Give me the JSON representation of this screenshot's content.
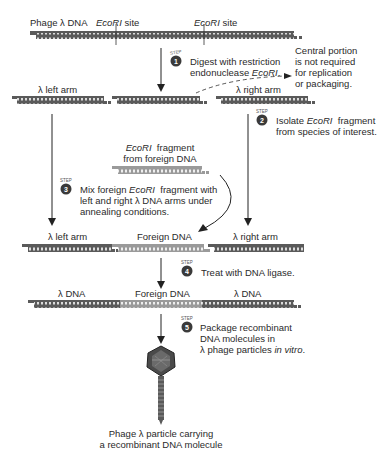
{
  "row1": {
    "label": "Phage λ DNA",
    "site1": "EcoRI",
    "site1_suffix": " site",
    "site2": "EcoRI",
    "site2_suffix": " site"
  },
  "step1": {
    "number": "1",
    "badge": "STEP",
    "line1": "Digest with restriction",
    "line2_pre": "endonuclease ",
    "line2_italic": "EcoRI",
    "line2_post": "."
  },
  "central_note": {
    "lines": [
      "Central portion",
      "is not required",
      "for replication",
      "or packaging."
    ]
  },
  "row2": {
    "left": "λ left arm",
    "right": "λ right arm"
  },
  "step2": {
    "number": "2",
    "badge": "STEP",
    "line1_pre": "Isolate ",
    "line1_italic": "EcoRI",
    "line1_post": "  fragment",
    "line2": "from species of interest."
  },
  "fragment": {
    "line1_italic": "EcoRI",
    "line1_post": "  fragment",
    "line2": "from foreign DNA"
  },
  "step3": {
    "number": "3",
    "badge": "STEP",
    "line1_pre": "Mix foreign ",
    "line1_italic": "EcoRI",
    "line1_post": "  fragment with",
    "line2": "left and right λ DNA arms under",
    "line3": "annealing conditions."
  },
  "row3": {
    "left": "λ left arm",
    "middle": "Foreign DNA",
    "right": "λ right arm"
  },
  "step4": {
    "number": "4",
    "badge": "STEP",
    "text": "Treat with DNA ligase."
  },
  "row4": {
    "left": "λ DNA",
    "middle": "Foreign DNA",
    "right": "λ DNA"
  },
  "step5": {
    "number": "5",
    "badge": "STEP",
    "line1": "Package recombinant",
    "line2": "DNA molecules in",
    "line3_pre": "λ phage particles ",
    "line3_italic": "in vitro",
    "line3_post": "."
  },
  "caption": {
    "line1": "Phage λ particle carrying",
    "line2": "a recombinant DNA molecule"
  },
  "colors": {
    "lambda_dna": "#5a5a5a",
    "foreign_dna": "#9a9a9a",
    "badge": "#3a3a3a",
    "arrow": "#222222"
  }
}
